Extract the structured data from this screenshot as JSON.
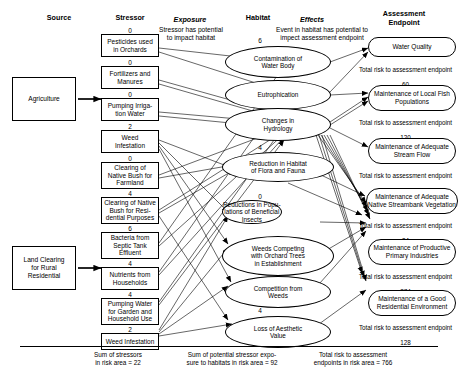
{
  "headers": {
    "source": "Source",
    "stressor": "Stressor",
    "exposure": "Exposure",
    "exposure_sub": "Stressor has potential\nto impact habitat",
    "habitat": "Habitat",
    "effects": "Effects",
    "effects_sub": "Event in habitat has potential to\nimpect assessment endpoint",
    "assessment_endpoint": "Assessment\nEndpoint"
  },
  "sources": [
    {
      "label": "Agriculture"
    },
    {
      "label": "Land Clearing\nfor Rural\nResidential"
    }
  ],
  "stressors": [
    {
      "score": "0",
      "label": "Pesticides used\nin Orchards"
    },
    {
      "score": "0",
      "label": "Fortilizers and\nManures"
    },
    {
      "score": "0",
      "label": "Pumping Irriga-\ntion Water"
    },
    {
      "score": "2",
      "label": "Weed\nInfestation"
    },
    {
      "score": "0",
      "label": "Clearing of\nNative Bush for\nFarmland"
    },
    {
      "score": "4",
      "label": "Clearing of Native\nBush for Resi-\ndential Purposes"
    },
    {
      "score": "6",
      "label": "Bacteria from\nSeptic Tank\nEffluent"
    },
    {
      "score": "4",
      "label": "Nutrients from\nHouseholds"
    },
    {
      "score": "4",
      "label": "Pumping Water\nfor Garden and\nHousehold Use"
    },
    {
      "score": "2",
      "label": "Weed Infestation"
    }
  ],
  "habitat_groups": [
    {
      "score": "6",
      "name": "Aquatic"
    },
    {
      "score": "4",
      "name": "Native Vegetation"
    },
    {
      "score": "0",
      "name": "Orchard"
    },
    {
      "score": "2",
      "name": "Pasture"
    },
    {
      "score": "4",
      "name": "Residential"
    }
  ],
  "habitats": [
    {
      "label": "Contamination of\nWater Body"
    },
    {
      "label": "Eutrophication"
    },
    {
      "label": "Changes in\nHydrology"
    },
    {
      "label": "Reduction in Habitat\nof Flora and Fauna"
    },
    {
      "label": "Reductions in Popu-\nlations of Beneficial\nInsects"
    },
    {
      "label": "Weeds Competing\nwith Orchard Trees\nin Establishment"
    },
    {
      "label": "Competition from\nWeeds"
    },
    {
      "label": "Loss of Aesthetic\nValue"
    }
  ],
  "endpoints": [
    {
      "label": "Water Quality",
      "total_caption": "Total risk to assessment endpoint",
      "total_value": "60"
    },
    {
      "label": "Maintenance of Local Fish\nPopulations",
      "total_caption": "Total risk to assessment endpoint",
      "total_value": "120"
    },
    {
      "label": "Maintenance of Adequate\nStream Flow",
      "total_caption": "Total risk to assessment endpoint",
      "total_value": "60"
    },
    {
      "label": "Maintenance of Adequate\nNative Streambank Vegetation",
      "total_caption": "Total risk to assessment endpoint",
      "total_value": "24"
    },
    {
      "label": "Maintenance of Productive\nPrimary Industries",
      "total_caption": "Total risk to assessment endpoint",
      "total_value": "374"
    },
    {
      "label": "Maintenance of a Good\nResidential Environment",
      "total_caption": "Total risk to assessment endpoint",
      "total_value": "128"
    }
  ],
  "summary": [
    {
      "text": "Sum of stressors\nin risk area = 22"
    },
    {
      "text": "Sum of potential stressor expo-\nsure to habitats in risk area = 92"
    },
    {
      "text": "Total risk to assessment\nendpoints in risk area = 766"
    }
  ]
}
